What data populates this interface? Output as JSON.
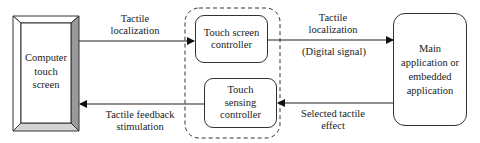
{
  "diagram": {
    "nodes": {
      "touch_screen": {
        "label": "Computer\ntouch\nscreen"
      },
      "touch_screen_controller": {
        "label": "Touch screen\ncontroller"
      },
      "touch_sensing_controller": {
        "label": "Touch\nsensing\ncontroller"
      },
      "main_application": {
        "label": "Main\napplication or\nembedded\napplication"
      }
    },
    "edges": {
      "screen_to_controller": {
        "label_line1": "Tactile",
        "label_line2": "localization"
      },
      "controller_to_app": {
        "label_line1": "Tactile",
        "label_line2": "localization",
        "sublabel": "(Digital signal)"
      },
      "app_to_sensing": {
        "label_line1": "Selected tactile",
        "label_line2": "effect"
      },
      "sensing_to_screen": {
        "label_line1": "Tactile feedback",
        "label_line2": "stimulation"
      }
    },
    "colors": {
      "line": "#222222",
      "bevel_dark": "#9a9a9a",
      "bevel_light": "#d4d4d4"
    }
  }
}
